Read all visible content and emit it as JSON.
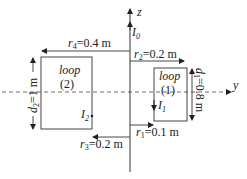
{
  "diagram": {
    "axes": {
      "z_label": "z",
      "y_label": "y"
    },
    "current_wire": {
      "label": "I",
      "subscript": "0"
    },
    "loop1": {
      "word": "loop",
      "number": "(1)",
      "current_label": "I",
      "current_subscript": "1"
    },
    "loop2": {
      "word": "loop",
      "number": "(2)",
      "current_label": "I",
      "current_subscript": "2"
    },
    "dimensions": {
      "r1": {
        "symbol": "r",
        "sub": "1",
        "value": "=0.1 m"
      },
      "r2": {
        "symbol": "r",
        "sub": "2",
        "value": "=0.2 m"
      },
      "r3": {
        "symbol": "r",
        "sub": "3",
        "value": "=0.2 m"
      },
      "r4": {
        "symbol": "r",
        "sub": "4",
        "value": "=0.4 m"
      },
      "d1": {
        "symbol": "d",
        "sub": "1",
        "value": "=0.8 m"
      },
      "d2": {
        "symbol": "d",
        "sub": "2",
        "value": "=1 m"
      }
    },
    "colors": {
      "line": "#333333",
      "text": "#222222",
      "background": "#ffffff"
    }
  }
}
